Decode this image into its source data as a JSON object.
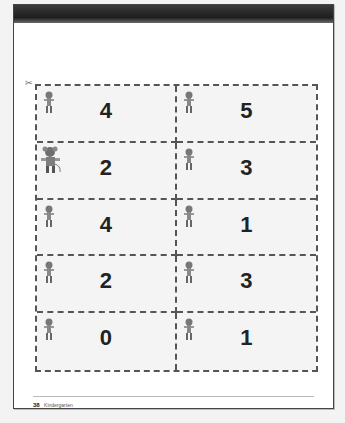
{
  "page": {
    "page_number": "38",
    "footer_label": "Kindergarten",
    "scissors_icon": "✂"
  },
  "cards": [
    {
      "value": "4",
      "figure": "mouse-figure"
    },
    {
      "value": "5",
      "figure": "mouse-figure"
    },
    {
      "value": "2",
      "figure": "mouse-figure-large"
    },
    {
      "value": "3",
      "figure": "mouse-figure"
    },
    {
      "value": "4",
      "figure": "mouse-figure"
    },
    {
      "value": "1",
      "figure": "mouse-figure"
    },
    {
      "value": "2",
      "figure": "mouse-figure"
    },
    {
      "value": "3",
      "figure": "mouse-figure"
    },
    {
      "value": "0",
      "figure": "mouse-figure"
    },
    {
      "value": "1",
      "figure": "mouse-figure"
    }
  ]
}
